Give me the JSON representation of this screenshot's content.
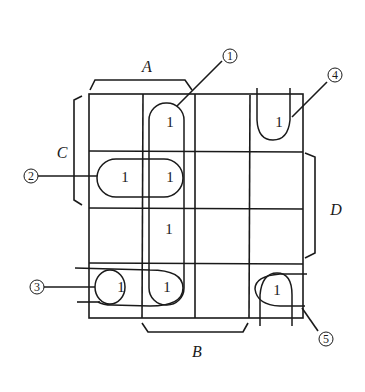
{
  "diagram": {
    "type": "karnaugh-map",
    "rows": 4,
    "cols": 4,
    "cells": [
      [
        "",
        "1",
        "",
        "1"
      ],
      [
        "1",
        "1",
        "",
        ""
      ],
      [
        "",
        "1",
        "",
        ""
      ],
      [
        "1",
        "1",
        "",
        "1"
      ]
    ],
    "variables": {
      "A": "A",
      "B": "B",
      "C": "C",
      "D": "D"
    },
    "groups": [
      {
        "id": "1",
        "label": "①",
        "desc": "vertical group column 2, all four rows"
      },
      {
        "id": "2",
        "label": "②",
        "desc": "horizontal pair row 2, columns 1-2"
      },
      {
        "id": "3",
        "label": "③",
        "desc": "bottom-left group wrapping to right edge"
      },
      {
        "id": "4",
        "label": "④",
        "desc": "top-right cell wrapping to bottom"
      },
      {
        "id": "5",
        "label": "⑤",
        "desc": "bottom-right cell wrapping"
      }
    ],
    "labels": {
      "g1": "1",
      "g2": "2",
      "g3": "3",
      "g4": "4",
      "g5": "5"
    }
  }
}
